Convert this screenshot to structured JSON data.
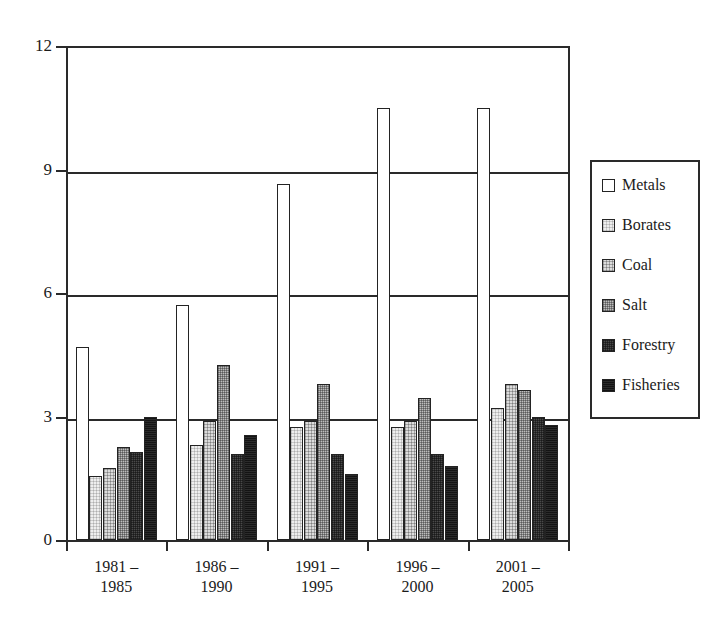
{
  "chart_data": {
    "type": "bar",
    "title": "",
    "subtitle": "",
    "xlabel": "",
    "ylabel": "",
    "grid": true,
    "legend_position": "right",
    "ylim": [
      0,
      12
    ],
    "yticks": [
      0,
      3,
      6,
      9,
      12
    ],
    "ytick_labels": [
      "0",
      "3",
      "6",
      "9",
      "12"
    ],
    "categories": [
      "1981 – 1985",
      "1986 – 1990",
      "1991 – 1995",
      "1996 – 2000",
      "2001 – 2005"
    ],
    "category_lines": [
      {
        "line1": "1981 –",
        "line2": "1985"
      },
      {
        "line1": "1986 –",
        "line2": "1990"
      },
      {
        "line1": "1991 –",
        "line2": "1995"
      },
      {
        "line1": "1996 –",
        "line2": "2000"
      },
      {
        "line1": "2001 –",
        "line2": "2005"
      }
    ],
    "series": [
      {
        "name": "Metals",
        "fill": "fill-metals",
        "swatch_color": "#ffffff",
        "values": [
          4.7,
          5.7,
          8.65,
          10.5,
          10.5
        ]
      },
      {
        "name": "Borates",
        "fill": "fill-borates",
        "swatch_color": "#eeeeee",
        "values": [
          1.55,
          2.3,
          2.75,
          2.75,
          3.2
        ]
      },
      {
        "name": "Coal",
        "fill": "fill-coal",
        "swatch_color": "#dcdcdc",
        "values": [
          1.75,
          2.9,
          2.9,
          2.9,
          3.8
        ]
      },
      {
        "name": "Salt",
        "fill": "fill-salt",
        "swatch_color": "#bdbdbd",
        "values": [
          2.25,
          4.25,
          3.8,
          3.45,
          3.65
        ]
      },
      {
        "name": "Forestry",
        "fill": "fill-forestry",
        "swatch_color": "#4a4a4a",
        "values": [
          2.15,
          2.1,
          2.1,
          2.1,
          3.0
        ]
      },
      {
        "name": "Fisheries",
        "fill": "fill-fisheries",
        "swatch_color": "#2b2b2b",
        "values": [
          3.0,
          2.55,
          1.6,
          1.8,
          2.8
        ]
      }
    ]
  },
  "legend": {
    "items": [
      {
        "label": "Metals"
      },
      {
        "label": "Borates"
      },
      {
        "label": "Coal"
      },
      {
        "label": "Salt"
      },
      {
        "label": "Forestry"
      },
      {
        "label": "Fisheries"
      }
    ]
  },
  "colors": {
    "axis": "#2a2a2a",
    "text": "#1b1b1b",
    "background": "#ffffff"
  }
}
